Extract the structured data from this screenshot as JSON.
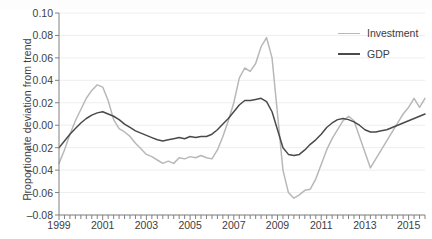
{
  "chart_data": {
    "type": "line",
    "title": "",
    "xlabel": "",
    "ylabel": "Proportionate deviation from trend",
    "xlim": [
      1999.0,
      2015.75
    ],
    "ylim": [
      -0.08,
      0.1
    ],
    "ytick_labels": [
      "0.10",
      "0.08",
      "0.06",
      "0.04",
      "0.02",
      "0.00",
      "–0.02",
      "–0.04",
      "–0.06",
      "–0.08"
    ],
    "ytick_values": [
      0.1,
      0.08,
      0.06,
      0.04,
      0.02,
      0.0,
      -0.02,
      -0.04,
      -0.06,
      -0.08
    ],
    "xtick_labels": [
      "1999",
      "2001",
      "2003",
      "2005",
      "2007",
      "2009",
      "2011",
      "2013",
      "2015"
    ],
    "xtick_values": [
      1999,
      2001,
      2003,
      2005,
      2007,
      2009,
      2011,
      2013,
      2015
    ],
    "minor_xtick_interval": 0.25,
    "grid": "horizontal",
    "legend_position": "top-right",
    "x": [
      1999.0,
      1999.25,
      1999.5,
      1999.75,
      2000.0,
      2000.25,
      2000.5,
      2000.75,
      2001.0,
      2001.25,
      2001.5,
      2001.75,
      2002.0,
      2002.25,
      2002.5,
      2002.75,
      2003.0,
      2003.25,
      2003.5,
      2003.75,
      2004.0,
      2004.25,
      2004.5,
      2004.75,
      2005.0,
      2005.25,
      2005.5,
      2005.75,
      2006.0,
      2006.25,
      2006.5,
      2006.75,
      2007.0,
      2007.25,
      2007.5,
      2007.75,
      2008.0,
      2008.25,
      2008.5,
      2008.75,
      2009.0,
      2009.25,
      2009.5,
      2009.75,
      2010.0,
      2010.25,
      2010.5,
      2010.75,
      2011.0,
      2011.25,
      2011.5,
      2011.75,
      2012.0,
      2012.25,
      2012.5,
      2012.75,
      2013.0,
      2013.25,
      2013.5,
      2013.75,
      2014.0,
      2014.25,
      2014.5,
      2014.75,
      2015.0,
      2015.25,
      2015.5,
      2015.75
    ],
    "series": [
      {
        "name": "Investment",
        "color": "#b8b8b8",
        "width": 1.5,
        "values": [
          -0.034,
          -0.022,
          -0.008,
          0.004,
          0.014,
          0.024,
          0.031,
          0.036,
          0.034,
          0.022,
          0.005,
          -0.003,
          -0.006,
          -0.01,
          -0.016,
          -0.021,
          -0.026,
          -0.028,
          -0.031,
          -0.034,
          -0.032,
          -0.034,
          -0.029,
          -0.03,
          -0.028,
          -0.029,
          -0.027,
          -0.029,
          -0.03,
          -0.022,
          -0.01,
          0.004,
          0.02,
          0.042,
          0.051,
          0.048,
          0.055,
          0.07,
          0.078,
          0.06,
          0.01,
          -0.04,
          -0.06,
          -0.065,
          -0.062,
          -0.058,
          -0.057,
          -0.048,
          -0.035,
          -0.022,
          -0.012,
          -0.004,
          0.004,
          0.008,
          0.004,
          -0.01,
          -0.024,
          -0.038,
          -0.03,
          -0.022,
          -0.014,
          -0.006,
          0.002,
          0.01,
          0.016,
          0.024,
          0.016,
          0.024
        ]
      },
      {
        "name": "GDP",
        "color": "#4a4a4a",
        "width": 1.5,
        "values": [
          -0.02,
          -0.014,
          -0.008,
          -0.003,
          0.002,
          0.006,
          0.009,
          0.011,
          0.012,
          0.01,
          0.008,
          0.005,
          0.001,
          -0.002,
          -0.005,
          -0.007,
          -0.009,
          -0.011,
          -0.013,
          -0.014,
          -0.013,
          -0.012,
          -0.011,
          -0.012,
          -0.01,
          -0.011,
          -0.01,
          -0.01,
          -0.008,
          -0.004,
          0.001,
          0.006,
          0.012,
          0.018,
          0.022,
          0.022,
          0.023,
          0.024,
          0.021,
          0.012,
          -0.004,
          -0.02,
          -0.026,
          -0.027,
          -0.026,
          -0.022,
          -0.017,
          -0.013,
          -0.008,
          -0.002,
          0.002,
          0.005,
          0.006,
          0.005,
          0.003,
          0.0,
          -0.004,
          -0.006,
          -0.006,
          -0.005,
          -0.004,
          -0.002,
          0.0,
          0.002,
          0.004,
          0.006,
          0.008,
          0.01
        ]
      }
    ],
    "legend": [
      {
        "label": "Investment",
        "color": "#b8b8b8"
      },
      {
        "label": "GDP",
        "color": "#4a4a4a"
      }
    ]
  },
  "axis": {
    "line_color": "#808080",
    "grid_color": "#eeeeee"
  }
}
